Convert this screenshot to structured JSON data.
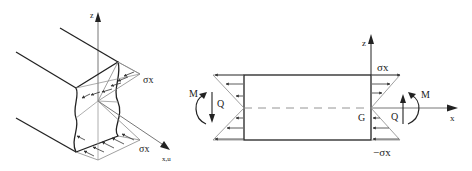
{
  "left_figure": {
    "title": "3D beam section with bending stress distribution",
    "labels": {
      "z_axis": "z",
      "x_axis": "x,u",
      "sigma_top": "σx",
      "sigma_bottom": "σx"
    }
  },
  "right_figure": {
    "title": "Beam element with internal forces and linear stress distribution",
    "labels": {
      "z_axis": "z",
      "x_axis": "x",
      "sigma_top": "σx",
      "sigma_bottom": "−σx",
      "centroid": "G",
      "moment_left": "M",
      "shear_left": "Q",
      "moment_right": "M",
      "shear_right": "Q"
    }
  },
  "colors": {
    "line_dark": "#222222",
    "line_light": "#888888",
    "background": "#ffffff"
  }
}
